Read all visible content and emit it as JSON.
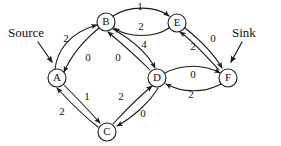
{
  "diagram": {
    "type": "directed-graph",
    "canvas": {
      "width": 281,
      "height": 146
    },
    "colors": {
      "stroke": "#1a1a1a",
      "background": "#ffffff",
      "text": "#111111"
    },
    "nodes": [
      {
        "id": "A",
        "label": "A",
        "x": 57,
        "y": 78,
        "r": 9
      },
      {
        "id": "B",
        "label": "B",
        "x": 106,
        "y": 22,
        "r": 9
      },
      {
        "id": "C",
        "label": "C",
        "x": 107,
        "y": 132,
        "r": 9
      },
      {
        "id": "D",
        "label": "D",
        "x": 157,
        "y": 78,
        "r": 9
      },
      {
        "id": "E",
        "label": "E",
        "x": 177,
        "y": 23,
        "r": 9
      },
      {
        "id": "F",
        "label": "F",
        "x": 228,
        "y": 78,
        "r": 9
      }
    ],
    "edges": [
      {
        "id": "A-B",
        "from": "A",
        "to": "B",
        "weight": "2",
        "label_x": 66,
        "label_y": 39
      },
      {
        "id": "B-A",
        "from": "B",
        "to": "A",
        "weight": "0",
        "label_x": 88,
        "label_y": 58
      },
      {
        "id": "B-E",
        "from": "B",
        "to": "E",
        "weight": "1",
        "label_x": 140,
        "label_y": 7
      },
      {
        "id": "E-B",
        "from": "E",
        "to": "B",
        "weight": "2",
        "label_x": 141,
        "label_y": 27
      },
      {
        "id": "B-D",
        "from": "B",
        "to": "D",
        "weight": "4",
        "label_x": 144,
        "label_y": 45
      },
      {
        "id": "D-B",
        "from": "D",
        "to": "B",
        "weight": "0",
        "label_x": 118,
        "label_y": 58
      },
      {
        "id": "E-F",
        "from": "E",
        "to": "F",
        "weight": "0",
        "label_x": 213,
        "label_y": 39
      },
      {
        "id": "F-E",
        "from": "F",
        "to": "E",
        "weight": "2",
        "label_x": 193,
        "label_y": 47
      },
      {
        "id": "D-F",
        "from": "D",
        "to": "F",
        "weight": "0",
        "label_x": 193,
        "label_y": 75
      },
      {
        "id": "F-D",
        "from": "F",
        "to": "D",
        "weight": "2",
        "label_x": 191,
        "label_y": 95
      },
      {
        "id": "A-C",
        "from": "A",
        "to": "C",
        "weight": "1",
        "label_x": 87,
        "label_y": 97
      },
      {
        "id": "C-A",
        "from": "C",
        "to": "A",
        "weight": "2",
        "label_x": 62,
        "label_y": 112
      },
      {
        "id": "C-D",
        "from": "C",
        "to": "D",
        "weight": "2",
        "label_x": 121,
        "label_y": 97
      },
      {
        "id": "D-C",
        "from": "D",
        "to": "C",
        "weight": "0",
        "label_x": 143,
        "label_y": 114
      }
    ],
    "annotations": [
      {
        "id": "source",
        "text": "Source",
        "text_x": 8,
        "text_y": 34,
        "arrow": "M 38 42 L 52 62"
      },
      {
        "id": "sink",
        "text": "Sink",
        "text_x": 232,
        "text_y": 34,
        "arrow": "M 242 42 L 231 62"
      }
    ]
  }
}
